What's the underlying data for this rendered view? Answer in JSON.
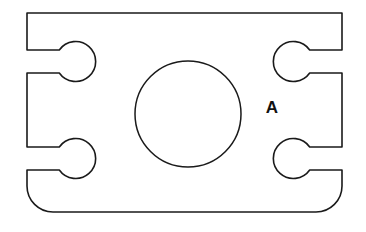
{
  "drawing": {
    "title": "Mechanical plate outline",
    "type": "technical-line-drawing",
    "background_color": "#ffffff",
    "line_color": "#1a1a1a",
    "line_width": 1.6,
    "canvas": {
      "width": 366,
      "height": 232
    },
    "body": {
      "name": "plate-outline",
      "left": 27,
      "top": 13,
      "right": 342,
      "bottom": 212,
      "width": 315,
      "height": 199,
      "top_left_corner": "sharp",
      "top_right_corner": "sharp",
      "bottom_left_corner": "rounded",
      "bottom_right_corner": "rounded",
      "bottom_corner_radius": 26
    },
    "center_hole": {
      "name": "center-hole",
      "shape": "circle",
      "center_x": 188,
      "center_y": 114,
      "radius": 53
    },
    "slots": [
      {
        "name": "slot-top-left",
        "side": "left",
        "lobe_center_x": 74,
        "lobe_center_y": 61,
        "lobe_radius": 20,
        "neck_top_y": 50,
        "neck_bottom_y": 73,
        "neck_opens_to": 27
      },
      {
        "name": "slot-top-right",
        "side": "right",
        "lobe_center_x": 295,
        "lobe_center_y": 61,
        "lobe_radius": 20,
        "neck_top_y": 50,
        "neck_bottom_y": 73,
        "neck_opens_to": 342
      },
      {
        "name": "slot-bottom-left",
        "side": "left",
        "lobe_center_x": 74,
        "lobe_center_y": 159,
        "lobe_radius": 20,
        "neck_top_y": 147,
        "neck_bottom_y": 170,
        "neck_opens_to": 27
      },
      {
        "name": "slot-bottom-right",
        "side": "right",
        "lobe_center_x": 295,
        "lobe_center_y": 159,
        "lobe_radius": 20,
        "neck_top_y": 147,
        "neck_bottom_y": 170,
        "neck_opens_to": 342
      }
    ],
    "labels": [
      {
        "name": "label-a",
        "text": "A",
        "x": 272,
        "y": 113,
        "font_size": 17,
        "bold": true
      }
    ]
  }
}
